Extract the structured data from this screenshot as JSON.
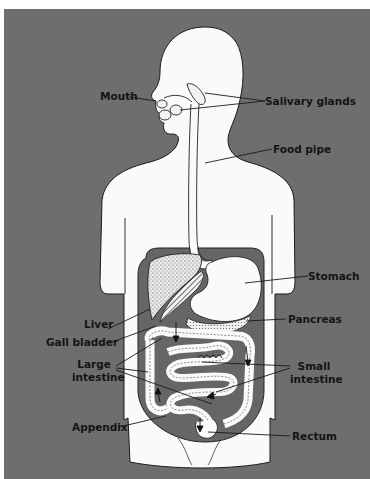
{
  "diagram": {
    "colors": {
      "background": "#6e6e6e",
      "body": "#fafafa",
      "cavity": "#666666",
      "outline": "#1a1a1a",
      "label": "#141414"
    },
    "labels": {
      "mouth": "Mouth",
      "salivary_glands": "Salivary glands",
      "food_pipe": "Food pipe",
      "stomach": "Stomach",
      "liver": "Liver",
      "pancreas": "Pancreas",
      "gall_bladder": "Gall bladder",
      "large_intestine_1": "Large",
      "large_intestine_2": "intestine",
      "small_intestine_1": "Small",
      "small_intestine_2": "intestine",
      "appendix": "Appendix",
      "rectum": "Rectum"
    }
  }
}
